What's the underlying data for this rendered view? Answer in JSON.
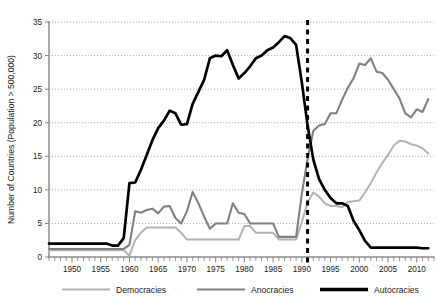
{
  "chart_data": {
    "type": "line",
    "title": "",
    "xlabel": "",
    "ylabel": "Number of Countries (Population > 500,000)",
    "xlim": [
      1946,
      2013
    ],
    "ylim": [
      0,
      35
    ],
    "ytick_step": 5,
    "xtick_step": 5,
    "xtick_minor_step": 1,
    "grid": "horizontal-dotted",
    "legend_position": "bottom",
    "yticks": [
      "0",
      "5",
      "10",
      "15",
      "20",
      "25",
      "30",
      "35"
    ],
    "xticks": [
      "1950",
      "1955",
      "1960",
      "1965",
      "1970",
      "1975",
      "1980",
      "1985",
      "1990",
      "1995",
      "2000",
      "2005",
      "2010"
    ],
    "annotations": [
      {
        "name": "soviet-collapse-marker",
        "type": "vertical-dashed-line",
        "x": 1991,
        "color": "#000000"
      }
    ],
    "colors": {
      "democracies": "#b3b3b3",
      "anocracies": "#808080",
      "autocracies": "#000000",
      "grid": "#8a8a8a",
      "axis": "#8c8c8c",
      "text": "#1a1a1a",
      "background": "#ffffff"
    },
    "x": [
      1946,
      1947,
      1948,
      1949,
      1950,
      1951,
      1952,
      1953,
      1954,
      1955,
      1956,
      1957,
      1958,
      1959,
      1960,
      1961,
      1962,
      1963,
      1964,
      1965,
      1966,
      1967,
      1968,
      1969,
      1970,
      1971,
      1972,
      1973,
      1974,
      1975,
      1976,
      1977,
      1978,
      1979,
      1980,
      1981,
      1982,
      1983,
      1984,
      1985,
      1986,
      1987,
      1988,
      1989,
      1990,
      1991,
      1992,
      1993,
      1994,
      1995,
      1996,
      1997,
      1998,
      1999,
      2000,
      2001,
      2002,
      2003,
      2004,
      2005,
      2006,
      2007,
      2008,
      2009,
      2010,
      2011,
      2012
    ],
    "series": [
      {
        "name": "Democracies",
        "color": "#b3b3b3",
        "values": [
          1,
          1,
          1,
          1,
          1,
          1,
          1,
          1,
          1,
          1,
          1,
          1,
          1,
          1,
          0.2,
          2.5,
          3.6,
          4.4,
          4.4,
          4.4,
          4.4,
          4.4,
          4.4,
          3.6,
          2.6,
          2.6,
          2.6,
          2.6,
          2.6,
          2.6,
          2.6,
          2.6,
          2.6,
          2.6,
          4.6,
          4.6,
          3.6,
          3.6,
          3.6,
          3.6,
          2.6,
          2.6,
          2.6,
          2.6,
          5.2,
          8.2,
          9.6,
          9.0,
          8.0,
          7.6,
          7.6,
          7.4,
          8.2,
          8.3,
          8.4,
          9.6,
          11.0,
          12.6,
          14.0,
          15.2,
          16.6,
          17.3,
          17.2,
          16.8,
          16.6,
          16.2,
          15.4
        ]
      },
      {
        "name": "Anocracies",
        "color": "#808080",
        "values": [
          1.2,
          1.2,
          1.2,
          1.2,
          1.2,
          1.2,
          1.2,
          1.2,
          1.2,
          1.2,
          1.2,
          1.2,
          1.2,
          1.2,
          1.8,
          6.8,
          6.6,
          7.0,
          7.2,
          6.5,
          7.5,
          7.6,
          5.8,
          5.0,
          6.8,
          9.7,
          8.0,
          6.0,
          4.2,
          5.0,
          5.0,
          5.0,
          8.0,
          6.6,
          6.4,
          5.0,
          5.0,
          5.0,
          5.0,
          5.0,
          3.0,
          3.0,
          3.0,
          3.0,
          9.4,
          14.6,
          18.8,
          19.6,
          19.8,
          21.4,
          21.4,
          23.4,
          25.2,
          26.6,
          28.8,
          28.6,
          29.6,
          27.6,
          27.4,
          26.4,
          25.0,
          23.6,
          21.4,
          20.8,
          22.0,
          21.6,
          23.5
        ]
      },
      {
        "name": "Autocracies",
        "color": "#000000",
        "values": [
          2.0,
          2.0,
          2.0,
          2.0,
          2.0,
          2.0,
          2.0,
          2.0,
          2.0,
          2.0,
          2.0,
          1.7,
          1.7,
          2.8,
          11.0,
          11.1,
          13.0,
          15.2,
          17.4,
          19.2,
          20.3,
          21.8,
          21.4,
          19.7,
          19.8,
          22.8,
          24.6,
          26.4,
          29.6,
          30.0,
          29.9,
          30.8,
          28.6,
          26.6,
          27.4,
          28.4,
          29.6,
          30.0,
          30.8,
          31.2,
          32.0,
          32.9,
          32.6,
          31.6,
          26.0,
          19.6,
          14.5,
          11.6,
          10.0,
          8.8,
          8.0,
          8.0,
          7.6,
          5.4,
          4.0,
          2.4,
          1.4,
          1.4,
          1.4,
          1.4,
          1.4,
          1.4,
          1.4,
          1.4,
          1.4,
          1.3,
          1.3
        ]
      }
    ]
  },
  "legend": {
    "items": [
      {
        "label": "Democracies",
        "color": "#b3b3b3",
        "swatch_width": 2.0
      },
      {
        "label": "Anocracies",
        "color": "#808080",
        "swatch_width": 2.2
      },
      {
        "label": "Autocracies",
        "color": "#000000",
        "swatch_width": 3.4
      }
    ]
  }
}
